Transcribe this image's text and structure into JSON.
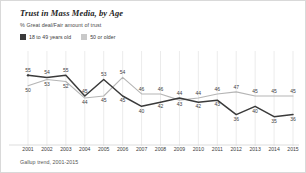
{
  "chart_data": {
    "type": "line",
    "title": "Trust in Mass Media, by Age",
    "subtitle": "% Great deal/Fair amount of trust",
    "xlabel": "",
    "ylabel": "",
    "ylim": [
      30,
      60
    ],
    "grid": "vertical",
    "legend_position": "top-left",
    "categories": [
      "2001",
      "2002",
      "2003",
      "2004",
      "2005",
      "2006",
      "2007",
      "2008",
      "2009",
      "2010",
      "2011",
      "2012",
      "2013",
      "2014",
      "2015"
    ],
    "series": [
      {
        "name": "18 to 49 years old",
        "color": "#3a3a3a",
        "values": [
          55,
          54,
          55,
          45,
          53,
          45,
          40,
          42,
          44,
          42,
          43,
          36,
          40,
          35,
          36
        ]
      },
      {
        "name": "50 or older",
        "color": "#b5b5b5",
        "values": [
          50,
          53,
          52,
          44,
          45,
          54,
          46,
          46,
          43,
          44,
          46,
          47,
          45,
          45,
          45
        ]
      }
    ],
    "source": "Gallup trend, 2001-2015"
  },
  "legend": {
    "items": [
      {
        "label": "18 to 49 years old",
        "color": "#3a3a3a"
      },
      {
        "label": "50 or older",
        "color": "#b5b5b5"
      }
    ]
  }
}
